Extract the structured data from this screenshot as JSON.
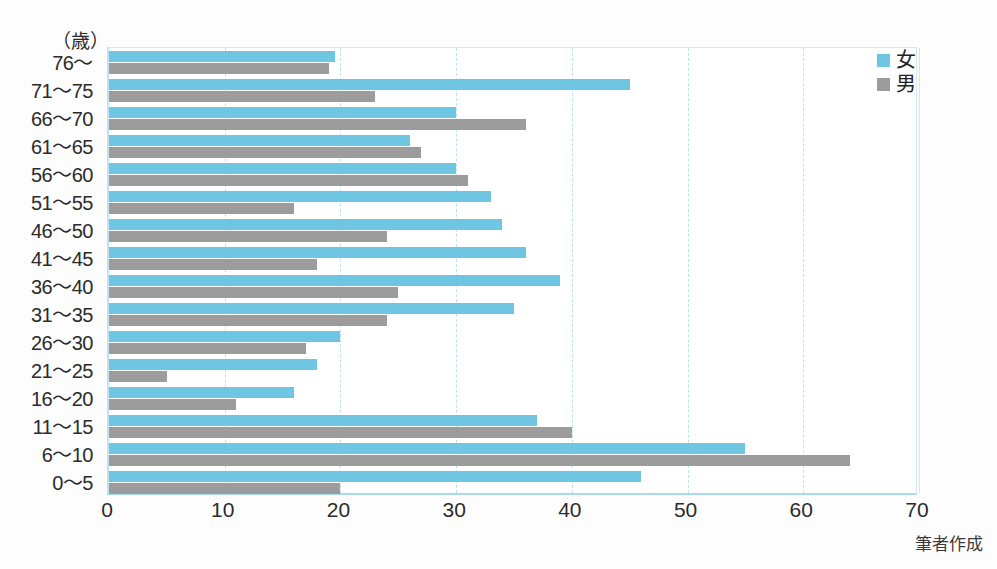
{
  "unit_label": "（歳）",
  "source_caption": "筆者作成",
  "legend": {
    "position": "top-right",
    "items": [
      {
        "label": "女",
        "color": "#6fc6e2",
        "swatch_name": "female-swatch"
      },
      {
        "label": "男",
        "color": "#9c9c9c",
        "swatch_name": "male-swatch"
      }
    ]
  },
  "chart_data": {
    "type": "bar",
    "orientation": "horizontal",
    "title": "",
    "subtitle": "",
    "xlabel": "",
    "ylabel": "（歳）",
    "xlim": [
      0,
      70
    ],
    "ylim": null,
    "grid": true,
    "xticks": [
      0,
      10,
      20,
      30,
      40,
      50,
      60,
      70
    ],
    "xtick_labels": [
      "0",
      "10",
      "20",
      "30",
      "40",
      "50",
      "60",
      "70"
    ],
    "legend_position": "top-right",
    "categories": [
      "76～",
      "71～75",
      "66～70",
      "61～65",
      "56～60",
      "51～55",
      "46～50",
      "41～45",
      "36～40",
      "31～35",
      "26～30",
      "21～25",
      "16～20",
      "11～15",
      "6～10",
      "0～5"
    ],
    "series": [
      {
        "name": "女",
        "color": "#6fc6e2",
        "values": [
          19.5,
          45,
          30,
          26,
          30,
          33,
          34,
          36,
          39,
          35,
          20,
          18,
          16,
          37,
          55,
          46
        ]
      },
      {
        "name": "男",
        "color": "#9c9c9c",
        "values": [
          19,
          23,
          36,
          27,
          31,
          16,
          24,
          18,
          25,
          24,
          17,
          5,
          11,
          40,
          64,
          20
        ]
      }
    ],
    "annotations": [
      "筆者作成"
    ]
  }
}
